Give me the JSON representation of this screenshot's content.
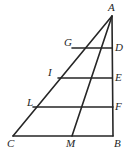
{
  "figure": {
    "kind": "geometry-diagram",
    "stroke_color": "#262626",
    "background_color": "#ffffff",
    "stroke_width": 1.6,
    "width": 129,
    "height": 155
  },
  "points": {
    "A": {
      "label": "A",
      "x": 112,
      "y": 16
    },
    "B": {
      "label": "B",
      "x": 113,
      "y": 136
    },
    "C": {
      "label": "C",
      "x": 13,
      "y": 136
    },
    "D": {
      "label": "D",
      "x": 112,
      "y": 48
    },
    "E": {
      "label": "E",
      "x": 112,
      "y": 78
    },
    "F": {
      "label": "F",
      "x": 113,
      "y": 107
    },
    "G": {
      "label": "G",
      "x": 72,
      "y": 48
    },
    "I": {
      "label": "I",
      "x": 58,
      "y": 78
    },
    "L": {
      "label": "L",
      "x": 33,
      "y": 107
    },
    "M": {
      "label": "M",
      "x": 72,
      "y": 136
    }
  },
  "segments": [
    {
      "name": "side-AB",
      "from": "A",
      "to": "B"
    },
    {
      "name": "side-AC",
      "from": "A",
      "to": "C"
    },
    {
      "name": "base-CB",
      "from": "C",
      "to": "B"
    },
    {
      "name": "transversal-GD",
      "from": "G",
      "to": "D"
    },
    {
      "name": "transversal-IE",
      "from": "I",
      "to": "E"
    },
    {
      "name": "transversal-LF",
      "from": "L",
      "to": "F"
    },
    {
      "name": "cevian-AM",
      "from": "A",
      "to": "M"
    }
  ],
  "labels": [
    {
      "name": "vertex-label-A",
      "text": "A"
    },
    {
      "name": "vertex-label-D",
      "text": "D"
    },
    {
      "name": "vertex-label-E",
      "text": "E"
    },
    {
      "name": "vertex-label-F",
      "text": "F"
    },
    {
      "name": "vertex-label-B",
      "text": "B"
    },
    {
      "name": "vertex-label-G",
      "text": "G"
    },
    {
      "name": "vertex-label-I",
      "text": "I"
    },
    {
      "name": "vertex-label-L",
      "text": "L"
    },
    {
      "name": "vertex-label-C",
      "text": "C"
    },
    {
      "name": "vertex-label-M",
      "text": "M"
    }
  ]
}
